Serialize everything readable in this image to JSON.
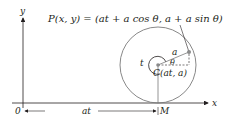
{
  "diagram": {
    "equation": "P(x, y) = (at + a cos θ, a + a sin θ)",
    "axes": {
      "x_label": "x",
      "y_label": "y",
      "origin_label": "0"
    },
    "labels": {
      "radius": "a",
      "angle": "θ",
      "rotation": "t",
      "center": "C(at, a)",
      "foot": "M",
      "distance": "at"
    },
    "colors": {
      "line": "#231f20",
      "circle": "#7a7a7a",
      "point": "#8a8a8a"
    }
  }
}
